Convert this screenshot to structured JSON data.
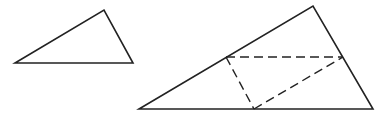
{
  "diagram": {
    "stroke_color": "#222222",
    "background": "#ffffff",
    "small_triangle": {
      "points": "15,63 104,10 133,63"
    },
    "large_triangle": {
      "points": "139,109 313,6 373,109"
    },
    "dashed_segments": [
      {
        "x1": 226,
        "y1": 57,
        "x2": 343,
        "y2": 57
      },
      {
        "x1": 226,
        "y1": 57,
        "x2": 254,
        "y2": 109
      },
      {
        "x1": 254,
        "y1": 109,
        "x2": 343,
        "y2": 57
      }
    ]
  }
}
